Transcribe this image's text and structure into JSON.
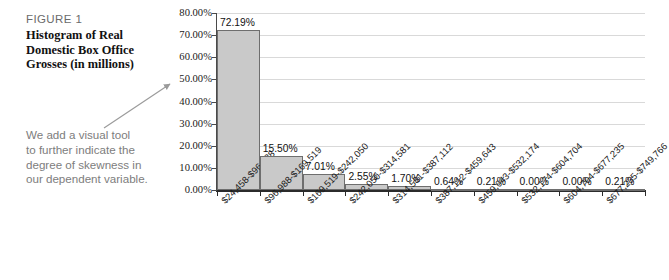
{
  "caption": {
    "figure_label": "FIGURE 1",
    "title_lines": [
      "Histogram of Real",
      "Domestic Box Office",
      "Grosses (in millions)"
    ],
    "title_text": "Histogram of Real Domestic Box Office Grosses (in millions)"
  },
  "annotation": {
    "lines": [
      "We add a visual tool",
      "to further indicate the",
      "degree of skewness in",
      "our dependent variable."
    ],
    "text": "We add a visual tool to further indicate the degree of skewness in our dependent variable.",
    "arrow": "arrow-pointing-to-chart"
  },
  "colors": {
    "bar_fill": "#c9c9c9",
    "bar_border": "#6e6e6e",
    "gridline": "#d9d9d9",
    "axis": "#2b2b2b",
    "figure_label_text": "#6b6b6b",
    "annotation_text": "#7d7d7d",
    "title_text": "#111111"
  },
  "chart_data": {
    "type": "bar",
    "title": "Histogram of Real Domestic Box Office Grosses (in millions)",
    "xlabel": "",
    "ylabel": "",
    "ylim": [
      0,
      80
    ],
    "ytick_labels": [
      "80.00%",
      "70.00%",
      "60.00%",
      "50.00%",
      "40.00%",
      "30.00%",
      "20.00%",
      "10.00%",
      "0.00%"
    ],
    "ytick_values": [
      80,
      70,
      60,
      50,
      40,
      30,
      20,
      10,
      0
    ],
    "grid": true,
    "legend": "none",
    "categories": [
      "$24,458-$96,988",
      "$96,988-$169,519",
      "$169,519-$242,050",
      "$242,050-$314,581",
      "$314,581-$387,112",
      "$387,112-$459,643",
      "$459,643-$532,174",
      "$532,174-$604,704",
      "$604,704-$677,235",
      "$677,235-$749,766"
    ],
    "values": [
      72.19,
      15.5,
      7.01,
      2.55,
      1.7,
      0.64,
      0.21,
      0.0,
      0.0,
      0.21
    ],
    "value_labels": [
      "72.19%",
      "15.50%",
      "7.01%",
      "2.55%",
      "1.70%",
      "0.64%",
      "0.21%",
      "0.00%",
      "0.00%",
      "0.21%"
    ]
  }
}
